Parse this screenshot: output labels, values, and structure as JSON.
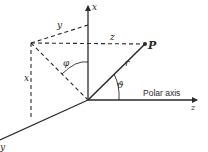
{
  "diagram": {
    "type": "spherical-coordinate-system",
    "colors": {
      "ink": "#2a2a2a",
      "background": "#ffffff"
    },
    "labels": {
      "x_axis": "x",
      "y_axis": "y",
      "z_axis": "z",
      "point": "P",
      "radius": "r",
      "polar_angle": "ϑ",
      "azimuth_angle": "φ",
      "polar_axis": "Polar axis",
      "dash_y": "y",
      "dash_z": "z",
      "dash_x": "x"
    }
  }
}
